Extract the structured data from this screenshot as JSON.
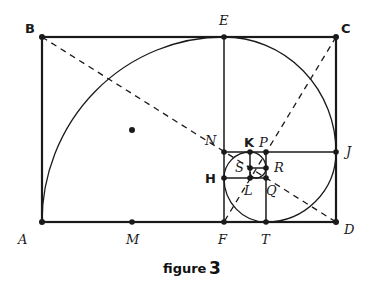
{
  "figure": {
    "caption_word": "figure",
    "caption_number": "3",
    "colors": {
      "ink": "#1a1a1a",
      "background": "#ffffff"
    },
    "points": {
      "A": {
        "label": "A",
        "x": 42,
        "y": 222
      },
      "B": {
        "label": "B",
        "x": 42,
        "y": 37
      },
      "C": {
        "label": "C",
        "x": 336,
        "y": 37
      },
      "D": {
        "label": "D",
        "x": 336,
        "y": 222
      },
      "E": {
        "label": "E",
        "x": 224,
        "y": 37
      },
      "F": {
        "label": "F",
        "x": 224,
        "y": 222
      },
      "M": {
        "label": "M",
        "x": 132,
        "y": 222
      },
      "J": {
        "label": "J",
        "x": 336,
        "y": 152
      },
      "N": {
        "label": "N",
        "x": 224,
        "y": 152
      },
      "T": {
        "label": "T",
        "x": 266,
        "y": 222
      },
      "P": {
        "label": "P",
        "x": 266,
        "y": 152
      },
      "H": {
        "label": "H",
        "x": 224,
        "y": 178
      },
      "K": {
        "label": "K",
        "x": 250,
        "y": 152
      },
      "Q": {
        "label": "Q",
        "x": 266,
        "y": 178
      },
      "R": {
        "label": "R",
        "x": 266,
        "y": 168
      },
      "S": {
        "label": "S",
        "x": 250,
        "y": 168
      },
      "L": {
        "label": "L",
        "x": 250,
        "y": 178
      }
    },
    "center_dot": {
      "x": 132,
      "y": 130
    },
    "dashed_diagonals": [
      "BD",
      "CF"
    ],
    "spiral": "golden spiral through A, E, J, T, H, K, R, ..."
  }
}
